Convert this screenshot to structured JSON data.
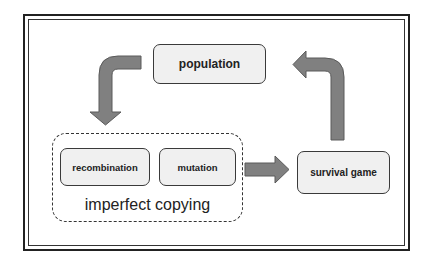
{
  "diagram": {
    "nodes": {
      "population": "population",
      "recombination": "recombination",
      "mutation": "mutation",
      "survival_game": "survival game"
    },
    "group_label": "imperfect copying",
    "edges": [
      {
        "from": "population",
        "to": "imperfect copying"
      },
      {
        "from": "imperfect copying",
        "to": "survival game"
      },
      {
        "from": "survival game",
        "to": "population"
      }
    ],
    "colors": {
      "arrow_fill": "#808080",
      "arrow_stroke": "#5a5a5a",
      "box_fill": "#f0f0f0",
      "box_border": "#3a3a3a",
      "frame": "#222222"
    }
  }
}
